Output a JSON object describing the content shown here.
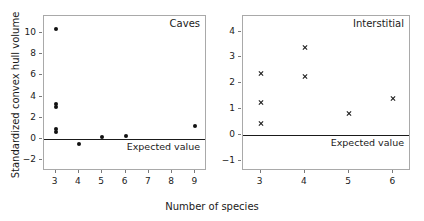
{
  "figure": {
    "xlabel": "Number of species",
    "ylabel": "Standardized convex hull volume"
  },
  "chart_data": [
    {
      "type": "scatter",
      "title": "Caves",
      "xlabel": "Number of species",
      "ylabel": "Standardized convex hull volume",
      "xlim": [
        2.5,
        9.5
      ],
      "ylim": [
        -3.0,
        11.6
      ],
      "xticks": [
        "3",
        "4",
        "5",
        "6",
        "7",
        "8",
        "9"
      ],
      "xtick_values": [
        3,
        4,
        5,
        6,
        7,
        8,
        9
      ],
      "yticks": [
        "-2",
        "0",
        "2",
        "4",
        "6",
        "8",
        "10"
      ],
      "ytick_values": [
        -2,
        0,
        2,
        4,
        6,
        8,
        10
      ],
      "grid": false,
      "legend": "none",
      "marker": "filled-circle",
      "reference_line": {
        "value": 0,
        "label": "Expected value"
      },
      "points": [
        {
          "x": 3,
          "y": 10.4
        },
        {
          "x": 3,
          "y": 3.3
        },
        {
          "x": 3,
          "y": 3.0
        },
        {
          "x": 3,
          "y": 1.0
        },
        {
          "x": 3,
          "y": 0.7
        },
        {
          "x": 4,
          "y": -0.5
        },
        {
          "x": 5,
          "y": 0.2
        },
        {
          "x": 6,
          "y": 0.3
        },
        {
          "x": 9,
          "y": 1.2
        }
      ]
    },
    {
      "type": "scatter",
      "title": "Interstitial",
      "xlabel": "Number of species",
      "ylabel": "Standardized convex hull volume",
      "xlim": [
        2.6,
        6.4
      ],
      "ylim": [
        -1.4,
        4.6
      ],
      "xticks": [
        "3",
        "4",
        "5",
        "6"
      ],
      "xtick_values": [
        3,
        4,
        5,
        6
      ],
      "yticks": [
        "-1",
        "0",
        "1",
        "2",
        "3",
        "4"
      ],
      "ytick_values": [
        -1,
        0,
        1,
        2,
        3,
        4
      ],
      "grid": false,
      "legend": "none",
      "marker": "cross",
      "reference_line": {
        "value": 0,
        "label": "Expected value"
      },
      "points": [
        {
          "x": 3,
          "y": 2.38
        },
        {
          "x": 3,
          "y": 1.25
        },
        {
          "x": 3,
          "y": 0.42
        },
        {
          "x": 4,
          "y": 3.38
        },
        {
          "x": 4,
          "y": 2.27
        },
        {
          "x": 5,
          "y": 0.83
        },
        {
          "x": 6,
          "y": 1.4
        }
      ]
    }
  ]
}
